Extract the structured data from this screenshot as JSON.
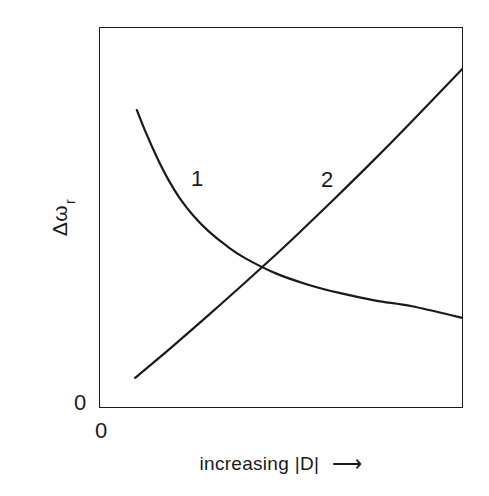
{
  "figure": {
    "background_color": "#ffffff",
    "ink_color": "#1a1a1a"
  },
  "axes": {
    "y_label_symbol": "Δω",
    "y_label_subscript": "r",
    "y_origin_label": "0",
    "x_origin_label": "0",
    "x_label_text": "increasing |D|",
    "x_label_arrow": "⟶"
  },
  "annotations": {
    "curve1_tag": "1",
    "curve2_tag": "2"
  },
  "chart_data": {
    "type": "line",
    "title": "",
    "xlabel": "increasing |D| ⟶",
    "ylabel": "Δω_r",
    "xlim": [
      0,
      100
    ],
    "ylim": [
      0,
      100
    ],
    "grid": false,
    "legend": "inline-curve-labels",
    "xticks": [
      "0"
    ],
    "yticks": [
      "0"
    ],
    "series": [
      {
        "name": "1",
        "style": "decaying-curve",
        "label_position": {
          "x": 27,
          "y": 57
        },
        "points": [
          {
            "x": 10.4,
            "y": 78.2
          },
          {
            "x": 13.0,
            "y": 72.0
          },
          {
            "x": 16.0,
            "y": 65.6
          },
          {
            "x": 19.0,
            "y": 60.0
          },
          {
            "x": 22.3,
            "y": 54.9
          },
          {
            "x": 26.0,
            "y": 50.4
          },
          {
            "x": 30.0,
            "y": 46.5
          },
          {
            "x": 35.0,
            "y": 42.6
          },
          {
            "x": 40.0,
            "y": 39.4
          },
          {
            "x": 48.4,
            "y": 35.4
          },
          {
            "x": 57.0,
            "y": 32.5
          },
          {
            "x": 66.0,
            "y": 30.2
          },
          {
            "x": 76.0,
            "y": 28.2
          },
          {
            "x": 86.0,
            "y": 26.7
          },
          {
            "x": 100.0,
            "y": 23.6
          }
        ]
      },
      {
        "name": "2",
        "style": "rising-near-linear",
        "label_position": {
          "x": 63,
          "y": 57
        },
        "points": [
          {
            "x": 9.9,
            "y": 7.9
          },
          {
            "x": 20.0,
            "y": 16.0
          },
          {
            "x": 30.0,
            "y": 24.3
          },
          {
            "x": 40.0,
            "y": 32.8
          },
          {
            "x": 48.4,
            "y": 40.1
          },
          {
            "x": 55.0,
            "y": 46.0
          },
          {
            "x": 65.0,
            "y": 55.2
          },
          {
            "x": 75.0,
            "y": 64.6
          },
          {
            "x": 85.0,
            "y": 74.3
          },
          {
            "x": 100.0,
            "y": 89.2
          }
        ]
      }
    ],
    "intersection": {
      "x": 48.4,
      "y": 35.4
    }
  }
}
